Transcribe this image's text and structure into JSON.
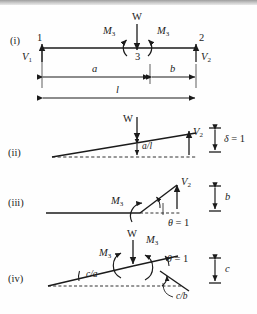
{
  "figure": {
    "stroke_color": "#1b1b1b",
    "panels": [
      {
        "id": "i",
        "number_label": "(i)",
        "description": "Loaded beam: supports 1 and 2, load W at joint 3, internal moments M3, reactions V1 and V2, span dimensions a, b and l",
        "labels": {
          "node_left": "1",
          "node_right": "2",
          "node_mid": "3",
          "load": "W",
          "moment_left": "M",
          "moment_left_sub": "3",
          "moment_right": "M",
          "moment_right_sub": "3",
          "reaction_left": "V",
          "reaction_left_sub": "1",
          "reaction_right": "V",
          "reaction_right_sub": "2",
          "dim_a": "a",
          "dim_b": "b",
          "dim_l": "l"
        }
      },
      {
        "id": "ii",
        "number_label": "(ii)",
        "description": "Unit vertical displacement mechanism: load W, ordinate a/l, reaction V2, scale delta = 1",
        "labels": {
          "load": "W",
          "ordinate": "a/l",
          "reaction_right": "V",
          "reaction_right_sub": "2",
          "scale_symbol": "δ",
          "scale_value": "= 1"
        }
      },
      {
        "id": "iii",
        "number_label": "(iii)",
        "description": "Unit rotation mechanism at support 2: moment M3, reaction V2, rotation theta = 1, scale dimension b",
        "labels": {
          "moment": "M",
          "moment_sub": "3",
          "reaction_right": "V",
          "reaction_right_sub": "2",
          "rotation_symbol": "θ",
          "rotation_value": "= 1",
          "scale": "b"
        }
      },
      {
        "id": "iv",
        "number_label": "(iv)",
        "description": "Unit rotation mechanism at hinge 3: load W, moments M3, rotations c/a and c/b, theta = 1, scale dimension c",
        "labels": {
          "load": "W",
          "moment_left": "M",
          "moment_left_sub": "3",
          "moment_right": "M",
          "moment_right_sub": "3",
          "rotation_left": "c/a",
          "rotation_right": "c/b",
          "rotation_symbol": "θ",
          "rotation_value": "= 1",
          "scale": "c"
        }
      }
    ]
  }
}
